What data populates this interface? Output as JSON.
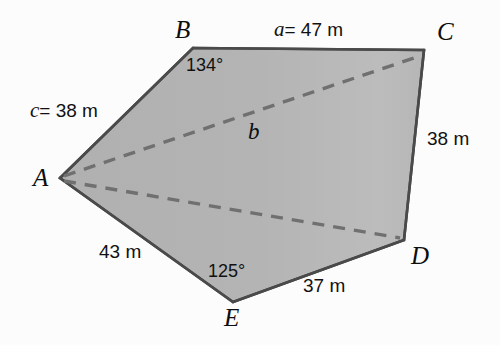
{
  "figure": {
    "type": "polygon-diagram",
    "shape": "pentagon",
    "colors": {
      "fill": "#b2b2b2",
      "fill_light": "#bdbdbd",
      "outline": "#4a4a4a",
      "dashed": "#6e6e6e",
      "background": "#fcfcfc",
      "text": "#111111"
    },
    "vertices": [
      {
        "name": "A",
        "label": "A",
        "x": 60,
        "y": 178,
        "label_x": 33,
        "label_y": 172
      },
      {
        "name": "B",
        "label": "B",
        "x": 193,
        "y": 48,
        "label_x": 175,
        "label_y": 19
      },
      {
        "name": "C",
        "label": "C",
        "x": 424,
        "y": 50,
        "label_x": 437,
        "label_y": 20
      },
      {
        "name": "D",
        "label": "D",
        "x": 404,
        "y": 240,
        "label_x": 411,
        "label_y": 245
      },
      {
        "name": "E",
        "label": "E",
        "x": 233,
        "y": 302,
        "label_x": 224,
        "label_y": 306
      }
    ],
    "edges": [
      {
        "name": "edge-AB",
        "from": "A",
        "to": "B"
      },
      {
        "name": "edge-BC",
        "from": "B",
        "to": "C"
      },
      {
        "name": "edge-CD",
        "from": "C",
        "to": "D"
      },
      {
        "name": "edge-DE",
        "from": "D",
        "to": "E"
      },
      {
        "name": "edge-EA",
        "from": "E",
        "to": "A"
      }
    ],
    "diagonals": [
      {
        "name": "diagonal-AC",
        "from": "A",
        "to": "C",
        "style": "dashed",
        "label": "b"
      },
      {
        "name": "diagonal-AD",
        "from": "A",
        "to": "D",
        "style": "dashed",
        "label": ""
      }
    ],
    "side_labels": [
      {
        "name": "side-label-c",
        "edge": "AB",
        "text": "c = 38 m",
        "var": "c",
        "rest": "= 38 m",
        "value": 38,
        "unit": "m",
        "x": 30,
        "y": 102
      },
      {
        "name": "side-label-a",
        "edge": "BC",
        "text": "a = 47 m",
        "var": "a",
        "rest": "= 47 m",
        "value": 47,
        "unit": "m",
        "x": 274,
        "y": 21
      },
      {
        "name": "side-label-cd",
        "edge": "CD",
        "text": "38 m",
        "value": 38,
        "unit": "m",
        "x": 427,
        "y": 131
      },
      {
        "name": "side-label-de",
        "edge": "DE",
        "text": "37 m",
        "value": 37,
        "unit": "m",
        "x": 303,
        "y": 278
      },
      {
        "name": "side-label-ea",
        "edge": "EA",
        "text": "43 m",
        "value": 43,
        "unit": "m",
        "x": 99,
        "y": 244
      }
    ],
    "angle_labels": [
      {
        "name": "angle-label-B",
        "vertex": "B",
        "text": "134°",
        "value": 134,
        "x": 186,
        "y": 58
      },
      {
        "name": "angle-label-E",
        "vertex": "E",
        "text": "125°",
        "value": 125,
        "x": 208,
        "y": 264
      }
    ],
    "diagonal_labels": [
      {
        "name": "diagonal-label-b",
        "text": "b",
        "x": 248,
        "y": 122
      }
    ]
  }
}
